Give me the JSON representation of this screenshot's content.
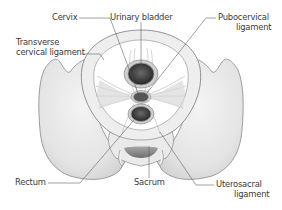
{
  "diagram": {
    "labels": {
      "cervix": "Cervix",
      "urinary_bladder": "Urinary bladder",
      "pubocervical_ligament_line1": "Pubocervical",
      "pubocervical_ligament_line2": "ligament",
      "transverse_cervical_line1": "Transverse",
      "transverse_cervical_line2": "cervical ligament",
      "rectum": "Rectum",
      "sacrum": "Sacrum",
      "uterosacral_line1": "Uterosacral",
      "uterosacral_line2": "ligament"
    },
    "colors": {
      "bone_fill": "#ebebeb",
      "bone_stroke": "#6e6e6e",
      "organ_dark": "#3c3c3c",
      "organ_ring": "#9a9a9a",
      "leader_line": "#555555",
      "text": "#3a3a3a"
    }
  }
}
